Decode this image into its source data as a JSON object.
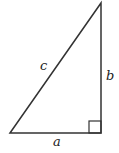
{
  "diagram": {
    "type": "right-triangle",
    "labels": {
      "hypotenuse": "c",
      "vertical_leg": "b",
      "horizontal_leg": "a"
    },
    "right_angle_marker": "square",
    "colors": {
      "stroke": "#333333",
      "background": "#ffffff"
    }
  }
}
